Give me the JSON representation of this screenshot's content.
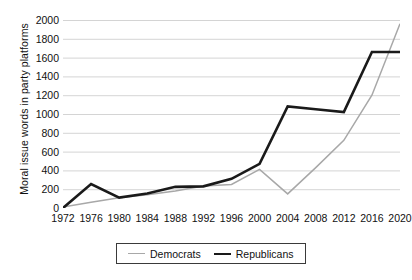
{
  "chart_data": {
    "type": "line",
    "title": "",
    "xlabel": "",
    "ylabel": "Moral issue words in party platforms",
    "x": [
      1972,
      1976,
      1980,
      1984,
      1988,
      1992,
      1996,
      2000,
      2004,
      2008,
      2012,
      2016,
      2020
    ],
    "xtick_labels": [
      "1972",
      "1976",
      "1980",
      "1984",
      "1988",
      "1992",
      "1996",
      "2000",
      "2004",
      "2008",
      "2012",
      "2016",
      "2020"
    ],
    "ytick_labels": [
      "2000",
      "1800",
      "1600",
      "1400",
      "1200",
      "1000",
      "800",
      "600",
      "400",
      "200",
      "0"
    ],
    "ytick_values": [
      2000,
      1800,
      1600,
      1400,
      1200,
      1000,
      800,
      600,
      400,
      200,
      0
    ],
    "ylim": [
      0,
      2000
    ],
    "xlim": [
      1972,
      2020
    ],
    "grid": "horizontal",
    "legend_position": "bottom-center",
    "series": [
      {
        "name": "Democrats",
        "color": "#a8a8a8",
        "line_width": 1.5,
        "values": [
          10,
          60,
          110,
          140,
          180,
          235,
          250,
          410,
          150,
          430,
          720,
          1200,
          1960
        ]
      },
      {
        "name": "Republicans",
        "color": "#1a1a1a",
        "line_width": 2.6,
        "values": [
          0,
          255,
          110,
          155,
          225,
          230,
          310,
          470,
          1080,
          1050,
          1020,
          1660,
          1660
        ]
      }
    ]
  },
  "legend": {
    "items": [
      {
        "label": "Democrats"
      },
      {
        "label": "Republicans"
      }
    ]
  },
  "colors": {
    "democrats": "#a8a8a8",
    "republicans": "#1a1a1a",
    "grid": "#c9c9c9",
    "axis": "#8f8f8f",
    "text": "#111111"
  }
}
